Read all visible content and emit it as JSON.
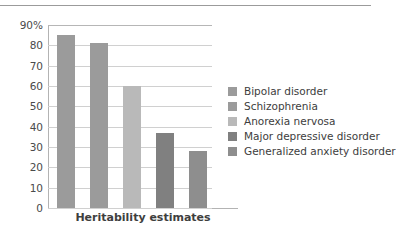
{
  "chart_data": {
    "type": "bar",
    "title": "",
    "xlabel": "Heritability estimates",
    "ylabel": "",
    "categories": [
      "Bipolar disorder",
      "Schizophrenia",
      "Anorexia nervosa",
      "Major depressive disorder",
      "Generalized anxiety disorder"
    ],
    "values": [
      85,
      81,
      60,
      37,
      28
    ],
    "colors": [
      "#9b9b9b",
      "#9b9b9b",
      "#b9b9b9",
      "#808080",
      "#8e8e8e"
    ],
    "ylim": [
      0,
      90
    ],
    "ytick_labels": [
      "90%",
      "80",
      "70",
      "60",
      "50",
      "40",
      "30",
      "20",
      "10",
      "0"
    ],
    "ytick_values": [
      90,
      80,
      70,
      60,
      50,
      40,
      30,
      20,
      10,
      0
    ],
    "grid": true,
    "legend_position": "right",
    "legend": [
      {
        "label": "Bipolar disorder",
        "color": "#9b9b9b"
      },
      {
        "label": "Schizophrenia",
        "color": "#9b9b9b"
      },
      {
        "label": "Anorexia nervosa",
        "color": "#b9b9b9"
      },
      {
        "label": "Major depressive disorder",
        "color": "#808080"
      },
      {
        "label": "Generalized anxiety disorder",
        "color": "#8e8e8e"
      }
    ]
  }
}
